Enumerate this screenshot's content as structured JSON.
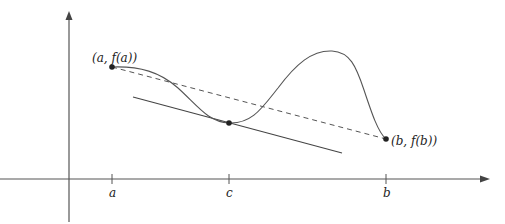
{
  "figure": {
    "colors": {
      "axis": "#555555",
      "curve": "#555555",
      "secant": "#555555",
      "tangent": "#444444",
      "point": "#222222"
    },
    "axes": {
      "x_tick_labels": [
        "a",
        "c",
        "b"
      ]
    },
    "points": {
      "a_label": "(a, f(a))",
      "b_label": "(b, f(b))"
    },
    "lines": {
      "secant": "dashed secant from (a, f(a)) to (b, f(b))",
      "tangent": "tangent at c parallel to secant"
    }
  }
}
